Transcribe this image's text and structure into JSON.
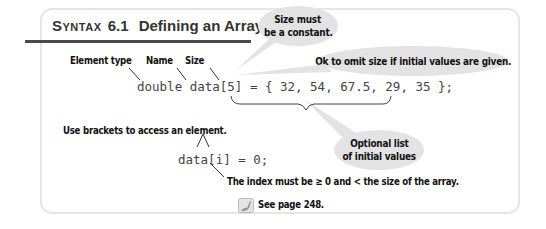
{
  "header": {
    "syntax_label": "Syntax",
    "syntax_number": "6.1",
    "title": "Defining an Array"
  },
  "labels": {
    "element_type": "Element type",
    "name": "Name",
    "size": "Size",
    "use_brackets": "Use brackets to access an element.",
    "index_rule": "The index must be ≥ 0 and < the size of the array.",
    "see_page": "See page 248."
  },
  "bubbles": {
    "size_constant_line1": "Size must",
    "size_constant_line2": "be a constant.",
    "omit_size": "Ok to omit size if initial values are given.",
    "optional_list_line1": "Optional list",
    "optional_list_line2": "of initial values"
  },
  "code": {
    "declaration": "double data[5] = { 32, 54, 67.5, 29, 35 };",
    "access": "data[i] = 0;"
  },
  "icons": {
    "cross_reference": "kangaroo-icon"
  },
  "colors": {
    "bubble": "#e3e3e3",
    "frame_border": "#e6e6e6",
    "rule": "#4a4a4a",
    "code_text": "#444444"
  }
}
